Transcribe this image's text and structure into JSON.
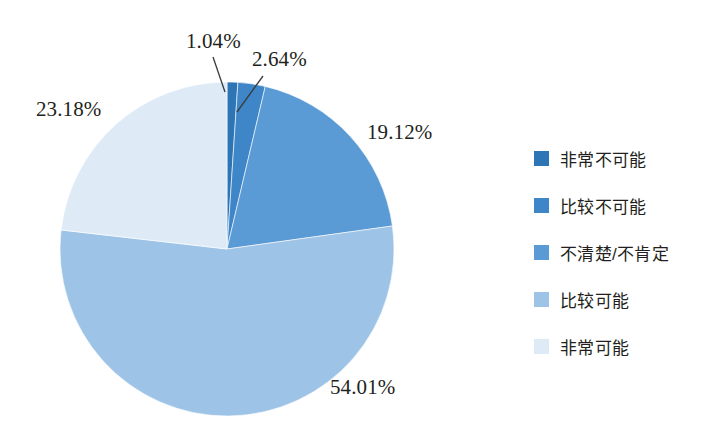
{
  "chart_data": {
    "type": "pie",
    "title": "",
    "subtitle": "",
    "xlabel": "",
    "ylabel": "",
    "legend_position": "right",
    "grid": false,
    "unit": "%",
    "categories": [
      "非常不可能",
      "比较不可能",
      "不清楚/不肯定",
      "比较可能",
      "非常可能"
    ],
    "values": [
      1.04,
      2.64,
      19.12,
      54.01,
      23.18
    ],
    "data_labels": [
      "1.04%",
      "2.64%",
      "19.12%",
      "54.01%",
      "23.18%"
    ],
    "colors": [
      "#2E75B6",
      "#3E86C8",
      "#5B9BD5",
      "#9DC3E6",
      "#DEEBF7"
    ],
    "start_angle_deg": 0,
    "direction": "clockwise",
    "slices": [
      {
        "label": "非常不可能",
        "value": 1.04,
        "data_label": "1.04%",
        "color": "#2E75B6",
        "has_leader_line": true
      },
      {
        "label": "比较不可能",
        "value": 2.64,
        "data_label": "2.64%",
        "color": "#3E86C8",
        "has_leader_line": true
      },
      {
        "label": "不清楚/不肯定",
        "value": 19.12,
        "data_label": "19.12%",
        "color": "#5B9BD5",
        "has_leader_line": false
      },
      {
        "label": "比较可能",
        "value": 54.01,
        "data_label": "54.01%",
        "color": "#9DC3E6",
        "has_leader_line": false
      },
      {
        "label": "非常可能",
        "value": 23.18,
        "data_label": "23.18%",
        "color": "#DEEBF7",
        "has_leader_line": false
      }
    ]
  },
  "legend": {
    "items": [
      {
        "label": "非常不可能",
        "color": "#2E75B6"
      },
      {
        "label": "比较不可能",
        "color": "#3E86C8"
      },
      {
        "label": "不清楚/不肯定",
        "color": "#5B9BD5"
      },
      {
        "label": "比较可能",
        "color": "#9DC3E6"
      },
      {
        "label": "非常可能",
        "color": "#DEEBF7"
      }
    ]
  },
  "labels": {
    "p1": "1.04%",
    "p2": "2.64%",
    "p3": "19.12%",
    "p4": "54.01%",
    "p5": "23.18%"
  }
}
